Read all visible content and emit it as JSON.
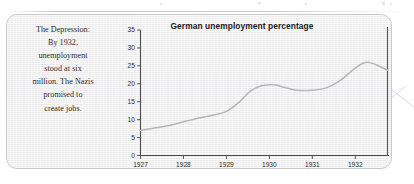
{
  "caption": {
    "text": "The Depression:\nBy 1932,\nunemployment\nstood at six\nmillion. The Nazis\npromised to\ncreate jobs."
  },
  "chart_data": {
    "type": "line",
    "title": "German unemployment percentage",
    "xlabel": "",
    "ylabel": "",
    "xlim": [
      1927,
      1932.75
    ],
    "ylim": [
      0,
      35
    ],
    "yticks": [
      "0",
      "5",
      "10",
      "15",
      "20",
      "25",
      "30",
      "35"
    ],
    "ytick_values": [
      0,
      5,
      10,
      15,
      20,
      25,
      30,
      35
    ],
    "xticks": [
      "1927",
      "1928",
      "1929",
      "1930",
      "1931",
      "1932"
    ],
    "xtick_values": [
      1927,
      1928,
      1929,
      1930,
      1931,
      1932
    ],
    "grid": false,
    "legend": null,
    "series": [
      {
        "name": "German unemployment percentage",
        "line_color": "#b6b6b8",
        "x": [
          1927.0,
          1927.3,
          1927.6,
          1928.0,
          1928.35,
          1928.7,
          1929.0,
          1929.3,
          1929.55,
          1929.8,
          1930.1,
          1930.4,
          1930.65,
          1931.0,
          1931.35,
          1931.7,
          1932.0,
          1932.3,
          1932.75
        ],
        "values": [
          7.0,
          7.6,
          8.2,
          9.4,
          10.4,
          11.3,
          12.3,
          14.9,
          17.9,
          19.4,
          19.7,
          18.8,
          18.2,
          18.2,
          19.0,
          21.4,
          24.4,
          26.0,
          23.8
        ]
      }
    ]
  },
  "colors": {
    "card_background": "#f1f1f1",
    "card_border": "#c9c9cc",
    "axis": "#4a4a4a",
    "frame": "#5a5a5a",
    "line": "#b6b6b8",
    "text": "#2b2b2b"
  }
}
